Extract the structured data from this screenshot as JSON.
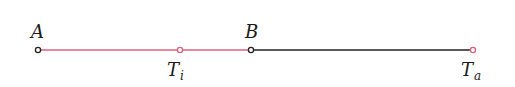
{
  "diagram": {
    "colors": {
      "red_segment": "#e0607a",
      "black_segment": "#222222",
      "point_black": "#222222",
      "point_red": "#d9607a"
    },
    "segments": [
      {
        "from": "A",
        "to": "B",
        "color": "red"
      },
      {
        "from": "B",
        "to": "Ta",
        "color": "black"
      }
    ],
    "points": {
      "A": {
        "label": "A",
        "x": 38,
        "y": 50,
        "color": "black"
      },
      "Ti": {
        "label": "T",
        "subscript": "i",
        "x": 180,
        "y": 50,
        "color": "red"
      },
      "B": {
        "label": "B",
        "x": 251,
        "y": 50,
        "color": "black"
      },
      "Ta": {
        "label": "T",
        "subscript": "a",
        "x": 473,
        "y": 50,
        "color": "red"
      }
    }
  }
}
